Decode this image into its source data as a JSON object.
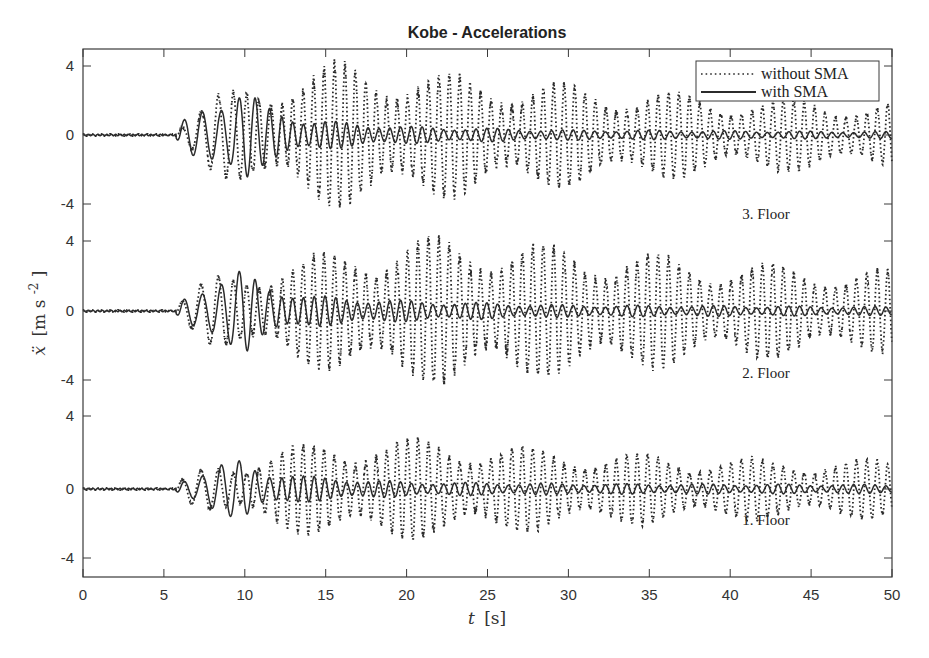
{
  "chart_data": {
    "type": "line",
    "title": "Kobe - Accelerations",
    "xlabel": "t [s]",
    "xlabel_italic_part": "t",
    "xlabel_unit": "[s]",
    "ylabel": "ẍ [m s^-2]",
    "ylabel_symbol": "ẍ",
    "ylabel_unit": "[m s",
    "ylabel_unit_exp": "-2",
    "ylabel_unit_close": "]",
    "xlim": [
      0,
      50
    ],
    "x_ticks": [
      "0",
      "5",
      "10",
      "15",
      "20",
      "25",
      "30",
      "35",
      "40",
      "45",
      "50"
    ],
    "grid": false,
    "legend_position": "upper right",
    "legend": [
      {
        "label": "without SMA",
        "style": "dotted"
      },
      {
        "label": "with SMA",
        "style": "solid"
      }
    ],
    "subplots": [
      {
        "name": "3. Floor",
        "label": "3. Floor",
        "y_ticks": [
          "4",
          "0",
          "-4"
        ],
        "ylim": [
          -4.8,
          5.0
        ],
        "envelope_without_sma": {
          "t": [
            0,
            5.7,
            6,
            8,
            10,
            12,
            15,
            18,
            22,
            30,
            40,
            50
          ],
          "amp": [
            0.05,
            0.05,
            0.6,
            2.2,
            2.8,
            3.3,
            4.2,
            4.0,
            3.6,
            2.9,
            2.2,
            1.9
          ]
        },
        "envelope_with_sma": {
          "t": [
            0,
            5.7,
            6,
            8,
            10,
            11,
            14,
            20,
            30,
            50
          ],
          "amp": [
            0.05,
            0.05,
            0.7,
            2.2,
            2.8,
            1.8,
            0.9,
            0.5,
            0.3,
            0.2
          ]
        }
      },
      {
        "name": "2. Floor",
        "label": "2. Floor",
        "y_ticks": [
          "4",
          "0",
          "-4"
        ],
        "ylim": [
          -4.8,
          5.0
        ],
        "envelope_without_sma": {
          "t": [
            0,
            5.7,
            6,
            8,
            10,
            12,
            15,
            18,
            22,
            25,
            30,
            40,
            50
          ],
          "amp": [
            0.05,
            0.05,
            0.6,
            2.0,
            2.4,
            2.7,
            3.3,
            3.9,
            4.2,
            4.1,
            3.7,
            2.8,
            2.3
          ]
        },
        "envelope_with_sma": {
          "t": [
            0,
            5.7,
            6,
            8,
            10,
            11,
            14,
            20,
            30,
            50
          ],
          "amp": [
            0.05,
            0.05,
            0.6,
            2.0,
            2.4,
            1.6,
            0.9,
            0.6,
            0.35,
            0.25
          ]
        }
      },
      {
        "name": "1. Floor",
        "label": "1. Floor",
        "y_ticks": [
          "4",
          "0",
          "-4"
        ],
        "ylim": [
          -5.0,
          5.0
        ],
        "envelope_without_sma": {
          "t": [
            0,
            5.7,
            6,
            8,
            10,
            12,
            15,
            18,
            22,
            25,
            30,
            40,
            50
          ],
          "amp": [
            0.05,
            0.05,
            0.5,
            1.4,
            1.7,
            2.2,
            2.6,
            2.8,
            2.7,
            2.5,
            2.1,
            1.7,
            1.6
          ]
        },
        "envelope_with_sma": {
          "t": [
            0,
            5.7,
            6,
            8,
            10,
            11,
            14,
            20,
            30,
            50
          ],
          "amp": [
            0.05,
            0.05,
            0.5,
            1.4,
            1.6,
            1.1,
            0.7,
            0.4,
            0.3,
            0.25
          ]
        }
      }
    ]
  },
  "colors": {
    "axis": "#3a3a3a",
    "signal": "#2b2b2b",
    "background": "#ffffff"
  }
}
